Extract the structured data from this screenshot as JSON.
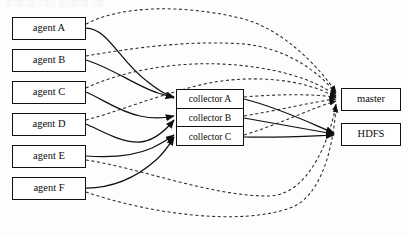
{
  "figure": {
    "type": "architecture-flow-diagram",
    "background_color": "#fdfdfd",
    "stroke_color": "#101010",
    "width": 408,
    "height": 237,
    "top_artifact_text": "▒░▒░▒ ░▒░ ▒░▒░▒ ░▒"
  },
  "nodes": {
    "agents": [
      {
        "id": "agent-a",
        "label": "agent A",
        "x": 12,
        "y": 17
      },
      {
        "id": "agent-b",
        "label": "agent B",
        "x": 12,
        "y": 49
      },
      {
        "id": "agent-c",
        "label": "agent C",
        "x": 12,
        "y": 81
      },
      {
        "id": "agent-d",
        "label": "agent D",
        "x": 12,
        "y": 113
      },
      {
        "id": "agent-e",
        "label": "agent E",
        "x": 12,
        "y": 145
      },
      {
        "id": "agent-f",
        "label": "agent F",
        "x": 12,
        "y": 177
      }
    ],
    "collectors": [
      {
        "id": "collector-a",
        "label": "collector A"
      },
      {
        "id": "collector-b",
        "label": "collector B"
      },
      {
        "id": "collector-c",
        "label": "collector C"
      }
    ],
    "sinks": [
      {
        "id": "master",
        "label": "master",
        "x": 341,
        "y": 88
      },
      {
        "id": "hdfs",
        "label": "HDFS",
        "x": 341,
        "y": 123
      }
    ]
  },
  "edges": {
    "legend": {
      "solid": "data flow (solid line with arrowhead)",
      "dashed": "control / heartbeat flow (dashed line with arrowhead)"
    },
    "agent_to_collector_solid": [
      {
        "from": "agent-a",
        "to": "collector-a"
      },
      {
        "from": "agent-b",
        "to": "collector-a"
      },
      {
        "from": "agent-c",
        "to": "collector-b"
      },
      {
        "from": "agent-d",
        "to": "collector-b"
      },
      {
        "from": "agent-e",
        "to": "collector-c"
      },
      {
        "from": "agent-f",
        "to": "collector-c"
      }
    ],
    "agent_to_master_dashed": [
      {
        "from": "agent-a",
        "to": "master"
      },
      {
        "from": "agent-b",
        "to": "master"
      },
      {
        "from": "agent-c",
        "to": "master"
      },
      {
        "from": "agent-d",
        "to": "master"
      },
      {
        "from": "agent-e",
        "to": "master"
      },
      {
        "from": "agent-f",
        "to": "master"
      }
    ],
    "collector_to_master_dashed": [
      {
        "from": "collector-a",
        "to": "master"
      },
      {
        "from": "collector-b",
        "to": "master"
      },
      {
        "from": "collector-c",
        "to": "master"
      }
    ],
    "collector_to_hdfs_solid": [
      {
        "from": "collector-a",
        "to": "hdfs"
      },
      {
        "from": "collector-b",
        "to": "hdfs"
      },
      {
        "from": "collector-c",
        "to": "hdfs"
      }
    ]
  }
}
